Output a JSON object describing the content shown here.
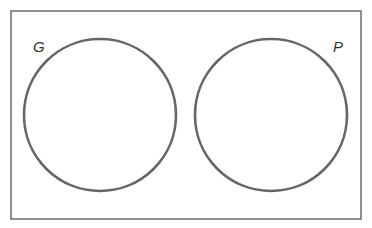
{
  "diagram": {
    "type": "venn",
    "universe": {
      "x": 11,
      "y": 11,
      "width": 350,
      "height": 208,
      "stroke": "#555555"
    },
    "sets": [
      {
        "label": "G",
        "cx": 100,
        "cy": 115,
        "r": 76,
        "stroke": "#666666",
        "label_x": 33,
        "label_y": 52
      },
      {
        "label": "P",
        "cx": 271,
        "cy": 115,
        "r": 76,
        "stroke": "#666666",
        "label_x": 333,
        "label_y": 52
      }
    ],
    "overlap": false
  }
}
